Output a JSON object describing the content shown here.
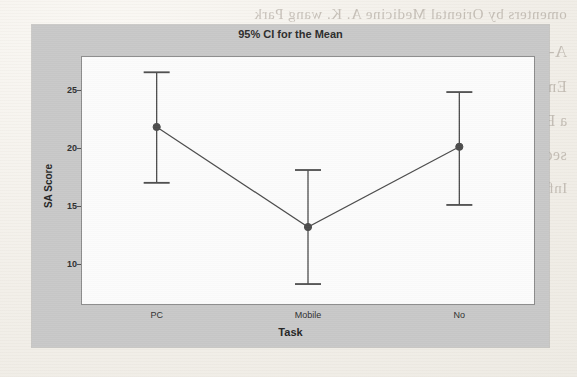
{
  "background": {
    "kind": "scanned-book-page",
    "bleed_through_lines": [
      "omenters by Oriental Medicine  A. K. wang Park",
      "A-P1079841-8.1021-21 X 23",
      "Emerging in Situation Awareness: A Large Effect on Inter-",
      "a Broad 16(1)",
      "sed Ex Learning. Heyerel in Distributed Awareness,",
      "Informations Bonndaries, Inside and stu."
    ]
  },
  "chart_data": {
    "type": "line",
    "title": "95% CI for the Mean",
    "xlabel": "Task",
    "ylabel": "SA Score",
    "categories": [
      "PC",
      "Mobile",
      "No"
    ],
    "yticks": [
      10,
      15,
      20,
      25
    ],
    "ylim": [
      6.5,
      27.9
    ],
    "grid": false,
    "legend": null,
    "error_bar_type": "95% confidence interval",
    "series": [
      {
        "name": "Mean SA Score",
        "values": [
          21.8,
          13.2,
          20.1
        ],
        "ci_lower": [
          17.0,
          8.3,
          15.1
        ],
        "ci_upper": [
          26.5,
          18.1,
          24.8
        ],
        "marker": "filled-circle",
        "color": "#4a4a4a"
      }
    ],
    "points": [
      {
        "category": "PC",
        "mean": 21.8,
        "ci_lower": 17.0,
        "ci_upper": 26.5
      },
      {
        "category": "Mobile",
        "mean": 13.2,
        "ci_lower": 8.3,
        "ci_upper": 18.1
      },
      {
        "category": "No",
        "mean": 20.1,
        "ci_lower": 15.1,
        "ci_upper": 24.8
      }
    ]
  },
  "colors": {
    "panel": "#c9c9c9",
    "plot_area": "#fdfdfd",
    "plot_border": "#8b8b8b",
    "series": "#4a4a4a",
    "text": "#1f1f1f"
  }
}
